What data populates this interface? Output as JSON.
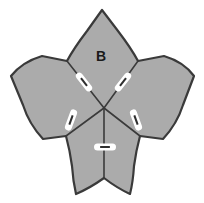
{
  "figure": {
    "name": "five-petal-flower-diagram",
    "background_color": "#ffffff",
    "canvas": {
      "width": 204,
      "height": 203
    }
  },
  "style": {
    "petal_fill": "#ababab",
    "petal_stroke": "#3a3a3a",
    "petal_stroke_width": 2.2,
    "fold_stroke": "#3a3a3a",
    "fold_stroke_width": 1.6,
    "mark_outline_color": "#ffffff",
    "mark_core_color": "#2e2e2e",
    "mark_outline_width": 7,
    "mark_core_width": 2,
    "label_color": "#1a1a1a",
    "label_font_size": 14
  },
  "labels": [
    {
      "id": "petal-label-b",
      "text": "B",
      "x": 101,
      "y": 57,
      "petal": "top"
    }
  ],
  "geometry": {
    "center": {
      "x": 104,
      "y": 108
    },
    "petal_outline_path": "M 102 10 L 118 31 Q 131 48 138 61 L 164 56 Q 184 62 194 76 L 183 105 Q 177 124 163 139 L 140 136 Q 136 151 134 166 Q 133 182 130 194 Q 117 188 104 178 Q 90 188 76 194 Q 73 181 72 166 Q 70 151 66 136 L 43 139 Q 29 124 23 105 L 11 76 Q 22 62 42 56 L 67 61 Q 74 48 87 31 Z",
    "petals": [
      {
        "id": "petal-top",
        "name": "top-petal",
        "path": "M 102 10 L 118 31 Q 131 48 138 61 L 104 108 L 67 61 Q 74 48 87 31 Z"
      },
      {
        "id": "petal-right",
        "name": "right-petal",
        "path": "M 138 61 L 164 56 Q 184 62 194 76 L 183 105 Q 177 124 163 139 L 140 136 L 104 108 Z"
      },
      {
        "id": "petal-bottom-right",
        "name": "bottom-right-petal",
        "path": "M 140 136 Q 136 151 134 166 Q 133 182 130 194 Q 117 188 104 178 L 104 108 Z"
      },
      {
        "id": "petal-bottom-left",
        "name": "bottom-left-petal",
        "path": "M 104 178 Q 90 188 76 194 Q 73 181 72 166 Q 70 151 66 136 L 104 108 Z"
      },
      {
        "id": "petal-left",
        "name": "left-petal",
        "path": "M 66 136 L 43 139 Q 29 124 23 105 L 11 76 Q 22 62 42 56 L 67 61 L 104 108 Z"
      }
    ],
    "fold_lines": [
      {
        "id": "fold-upper-left",
        "x1": 67,
        "y1": 61,
        "x2": 104,
        "y2": 108
      },
      {
        "id": "fold-upper-right",
        "x1": 138,
        "y1": 61,
        "x2": 104,
        "y2": 108
      },
      {
        "id": "fold-lower-right",
        "x1": 140,
        "y1": 136,
        "x2": 104,
        "y2": 108
      },
      {
        "id": "fold-lower-left",
        "x1": 66,
        "y1": 136,
        "x2": 104,
        "y2": 108
      },
      {
        "id": "fold-bottom",
        "x1": 104,
        "y1": 178,
        "x2": 104,
        "y2": 108
      }
    ],
    "tick_marks": [
      {
        "id": "tick-upper-left",
        "cx": 84,
        "cy": 82,
        "angle": 52,
        "length": 15
      },
      {
        "id": "tick-upper-right",
        "cx": 123,
        "cy": 82,
        "angle": -52,
        "length": 15
      },
      {
        "id": "tick-lower-left",
        "cx": 71,
        "cy": 120,
        "angle": -70,
        "length": 15
      },
      {
        "id": "tick-lower-right",
        "cx": 136,
        "cy": 120,
        "angle": 70,
        "length": 15
      },
      {
        "id": "tick-bottom",
        "cx": 105,
        "cy": 147,
        "angle": 0,
        "length": 15
      }
    ]
  }
}
